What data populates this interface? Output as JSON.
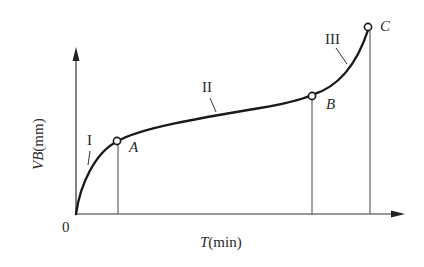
{
  "diagram": {
    "type": "tool-wear-curve",
    "axes": {
      "x_label_var": "T",
      "x_label_unit": "(min)",
      "y_label_var": "VB",
      "y_label_unit": "(mm)",
      "origin_label": "0"
    },
    "points": [
      {
        "name": "A",
        "label": "A"
      },
      {
        "name": "B",
        "label": "B"
      },
      {
        "name": "C",
        "label": "C"
      }
    ],
    "stages": [
      {
        "name": "I",
        "label": "I"
      },
      {
        "name": "II",
        "label": "II"
      },
      {
        "name": "III",
        "label": "III"
      }
    ],
    "colors": {
      "line": "#1a1a1a",
      "axis": "#333333",
      "background": "#ffffff"
    }
  }
}
